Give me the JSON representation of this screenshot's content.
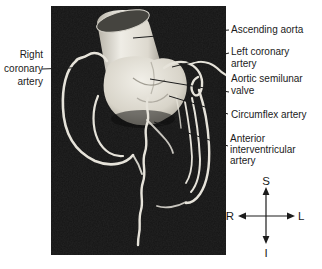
{
  "figure_type": "coronary-arteries-3d-angiogram-diagram",
  "annotations": {
    "right_coronary_artery": [
      "Right",
      "coronary",
      "artery"
    ],
    "ascending_aorta": [
      "Ascending aorta"
    ],
    "left_coronary_artery": [
      "Left coronary",
      "artery"
    ],
    "aortic_semilunar_valve": [
      "Aortic semilunar",
      "valve"
    ],
    "circumflex_artery": [
      "Circumflex artery"
    ],
    "anterior_interventricular_artery": [
      "Anterior",
      "interventricular",
      "artery"
    ]
  },
  "compass": {
    "superior": "S",
    "right": "R",
    "left": "L",
    "inferior": "I"
  },
  "colors": {
    "page_bg": "#ffffff",
    "panel_bg": "#141414",
    "vessel": "#e6e3da",
    "aorta_light": "#efede6",
    "aorta_cut_face": "#45443f",
    "leader_line": "#1c1c1c",
    "text": "#1b1b1b"
  }
}
